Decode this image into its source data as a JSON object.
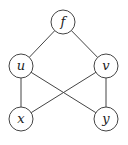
{
  "diagram": {
    "type": "graph",
    "nodes": [
      {
        "id": "f",
        "label": "f",
        "x": 63,
        "y": 22
      },
      {
        "id": "u",
        "label": "u",
        "x": 21,
        "y": 66
      },
      {
        "id": "v",
        "label": "v",
        "x": 106,
        "y": 66
      },
      {
        "id": "x",
        "label": "x",
        "x": 21,
        "y": 119
      },
      {
        "id": "y",
        "label": "y",
        "x": 106,
        "y": 119
      }
    ],
    "edges": [
      {
        "from": "f",
        "to": "u"
      },
      {
        "from": "f",
        "to": "v"
      },
      {
        "from": "u",
        "to": "x"
      },
      {
        "from": "u",
        "to": "y"
      },
      {
        "from": "v",
        "to": "x"
      },
      {
        "from": "v",
        "to": "y"
      }
    ],
    "node_radius": 12
  }
}
